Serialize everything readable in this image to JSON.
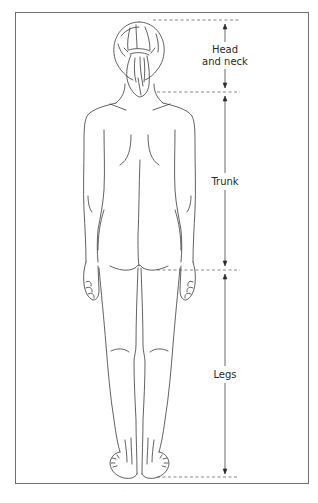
{
  "figure": {
    "title": "",
    "view": "posterior"
  },
  "segments": [
    {
      "id": "head_and_neck",
      "label_line1": "Head",
      "label_line2": "and neck",
      "top_y": 20,
      "bottom_y": 92
    },
    {
      "id": "trunk",
      "label_line1": "Trunk",
      "top_y": 92,
      "bottom_y": 270
    },
    {
      "id": "legs",
      "label_line1": "Legs",
      "top_y": 270,
      "bottom_y": 477
    }
  ],
  "colors": {
    "frame": "#6f6f6f",
    "line_art": "#3a3a3a",
    "dashed_guides": "#555555",
    "label_text": "#2a2a2a",
    "background": "#ffffff"
  }
}
